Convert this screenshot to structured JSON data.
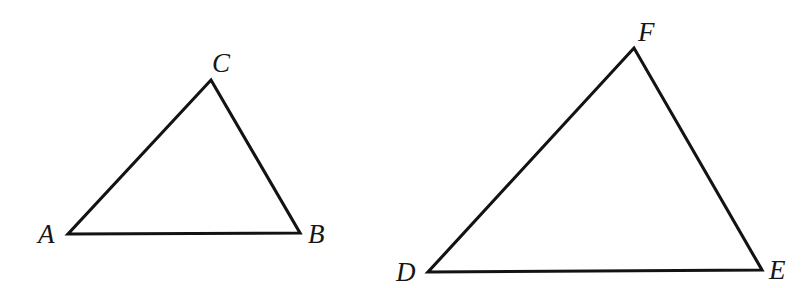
{
  "figure": {
    "background_color": "#ffffff",
    "stroke_color": "#131313",
    "label_color": "#161616",
    "stroke_width": 3.1,
    "canvas": {
      "width": 812,
      "height": 288
    }
  },
  "shapes": [
    {
      "id": "triangle-abc",
      "name": "triangle ABC",
      "type": "triangle",
      "vertices": [
        {
          "label": "A",
          "x": 68,
          "y": 234,
          "label_x": 38,
          "label_y": 243,
          "label_anchor": "start"
        },
        {
          "label": "B",
          "x": 300,
          "y": 233,
          "label_x": 308,
          "label_y": 243,
          "label_anchor": "start"
        },
        {
          "label": "C",
          "x": 211,
          "y": 80,
          "label_x": 212,
          "label_y": 72,
          "label_anchor": "start"
        }
      ],
      "edges": [
        {
          "name": "AC",
          "from": "A",
          "to": "C"
        },
        {
          "name": "CB",
          "from": "C",
          "to": "B"
        },
        {
          "name": "BA",
          "from": "B",
          "to": "A"
        }
      ]
    },
    {
      "id": "triangle-def",
      "name": "triangle DEF",
      "type": "triangle",
      "vertices": [
        {
          "label": "D",
          "x": 428,
          "y": 272,
          "label_x": 396,
          "label_y": 281,
          "label_anchor": "start"
        },
        {
          "label": "E",
          "x": 762,
          "y": 270,
          "label_x": 769,
          "label_y": 279,
          "label_anchor": "start"
        },
        {
          "label": "F",
          "x": 634,
          "y": 48,
          "label_x": 638,
          "label_y": 41,
          "label_anchor": "start"
        }
      ],
      "edges": [
        {
          "name": "DF",
          "from": "D",
          "to": "F"
        },
        {
          "name": "FE",
          "from": "F",
          "to": "E"
        },
        {
          "name": "ED",
          "from": "E",
          "to": "D"
        }
      ]
    }
  ],
  "labels": {
    "a": "A",
    "b": "B",
    "c": "C",
    "d": "D",
    "e": "E",
    "f": "F"
  }
}
